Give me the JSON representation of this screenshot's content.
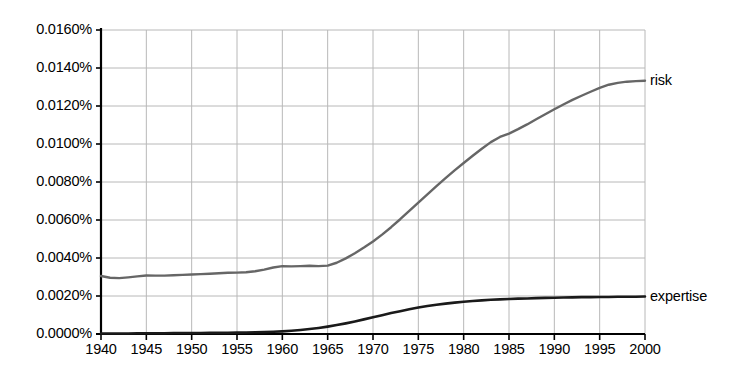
{
  "chart_data": {
    "type": "line",
    "title": "",
    "xlabel": "",
    "ylabel": "",
    "xlim": [
      1940,
      2000
    ],
    "ylim": [
      0.0,
      0.016
    ],
    "grid": true,
    "legend_position": "right-inline-labels",
    "y_tick_labels": [
      "0.0160%",
      "0.0140%",
      "0.0120%",
      "0.0100%",
      "0.0080%",
      "0.0060%",
      "0.0040%",
      "0.0020%",
      "0.0000%"
    ],
    "y_tick_values": [
      0.016,
      0.014,
      0.012,
      0.01,
      0.008,
      0.006,
      0.004,
      0.002,
      0.0
    ],
    "x_tick_labels": [
      "1940",
      "1945",
      "1950",
      "1955",
      "1960",
      "1965",
      "1970",
      "1975",
      "1980",
      "1985",
      "1990",
      "1995",
      "2000"
    ],
    "x_tick_values": [
      1940,
      1945,
      1950,
      1955,
      1960,
      1965,
      1970,
      1975,
      1980,
      1985,
      1990,
      1995,
      2000
    ],
    "x": [
      1940,
      1941,
      1942,
      1943,
      1944,
      1945,
      1946,
      1947,
      1948,
      1949,
      1950,
      1951,
      1952,
      1953,
      1954,
      1955,
      1956,
      1957,
      1958,
      1959,
      1960,
      1961,
      1962,
      1963,
      1964,
      1965,
      1966,
      1967,
      1968,
      1969,
      1970,
      1971,
      1972,
      1973,
      1974,
      1975,
      1976,
      1977,
      1978,
      1979,
      1980,
      1981,
      1982,
      1983,
      1984,
      1985,
      1986,
      1987,
      1988,
      1989,
      1990,
      1991,
      1992,
      1993,
      1994,
      1995,
      1996,
      1997,
      1998,
      1999,
      2000
    ],
    "series": [
      {
        "name": "risk",
        "color": "#666666",
        "values": [
          0.00305,
          0.00296,
          0.00294,
          0.00298,
          0.00303,
          0.00308,
          0.00307,
          0.00307,
          0.00309,
          0.00311,
          0.00313,
          0.00315,
          0.00317,
          0.0032,
          0.00322,
          0.00323,
          0.00325,
          0.0033,
          0.00339,
          0.0035,
          0.00357,
          0.00356,
          0.00357,
          0.00359,
          0.00357,
          0.0036,
          0.00375,
          0.00398,
          0.00425,
          0.00455,
          0.00487,
          0.00523,
          0.00562,
          0.00604,
          0.00648,
          0.00692,
          0.00735,
          0.00778,
          0.0082,
          0.00861,
          0.009,
          0.00938,
          0.00975,
          0.0101,
          0.01037,
          0.01055,
          0.01078,
          0.01103,
          0.0113,
          0.01157,
          0.01183,
          0.01208,
          0.01232,
          0.01254,
          0.01275,
          0.01295,
          0.01312,
          0.01322,
          0.01328,
          0.01331,
          0.01333
        ]
      },
      {
        "name": "expertise",
        "color": "#1a1a1a",
        "values": [
          3e-05,
          3e-05,
          3e-05,
          3e-05,
          4e-05,
          4e-05,
          4e-05,
          4e-05,
          5e-05,
          5e-05,
          5e-05,
          5e-05,
          6e-05,
          6e-05,
          6e-05,
          7e-05,
          8e-05,
          9e-05,
          0.0001,
          0.00012,
          0.00014,
          0.00017,
          0.00021,
          0.00026,
          0.00032,
          0.00039,
          0.00047,
          0.00056,
          0.00066,
          0.00077,
          0.00088,
          0.00099,
          0.0011,
          0.0012,
          0.0013,
          0.00139,
          0.00147,
          0.00154,
          0.0016,
          0.00165,
          0.0017,
          0.00174,
          0.00177,
          0.0018,
          0.00182,
          0.00184,
          0.00186,
          0.00187,
          0.00189,
          0.0019,
          0.00191,
          0.00192,
          0.00193,
          0.00194,
          0.00194,
          0.00195,
          0.00195,
          0.00196,
          0.00196,
          0.00196,
          0.00197
        ]
      }
    ],
    "annotations": [
      {
        "text": "risk",
        "series": "risk",
        "at_x": 2000
      },
      {
        "text": "expertise",
        "series": "expertise",
        "at_x": 2000
      }
    ]
  },
  "axes": {
    "plot_left_px": 101,
    "plot_right_px": 645,
    "plot_top_px": 30,
    "plot_bottom_px": 334,
    "axis_color": "#000000",
    "grid_color": "#b8b8b8"
  }
}
